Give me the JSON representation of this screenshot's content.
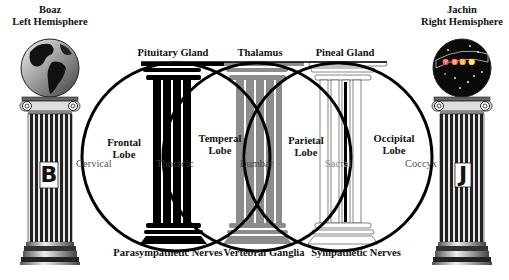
{
  "pillars": {
    "left": {
      "name": "Boaz",
      "subtitle": "Left Hemisphere",
      "letter": "B",
      "sphere": "terrestrial-globe"
    },
    "right": {
      "name": "Jachin",
      "subtitle": "Right Hemisphere",
      "letter": "J",
      "sphere": "celestial-globe"
    }
  },
  "inner_pillars": [
    {
      "top_label": "Pituitary Gland",
      "bottom_label": "Parasympathetic Nerves",
      "shaft_label": "Thoracic",
      "color": "#000000"
    },
    {
      "top_label": "Thalamus",
      "bottom_label": "Vertebral Ganglia",
      "shaft_label": "Lumbar",
      "color": "#8c8c8c"
    },
    {
      "top_label": "Pineal Gland",
      "bottom_label": "Sympathetic Nerves",
      "shaft_label": "Sacral",
      "color": "#ffffff"
    }
  ],
  "lobes": [
    {
      "label_line1": "Frontal",
      "label_line2": "Lobe"
    },
    {
      "label_line1": "Temperal",
      "label_line2": "Lobe"
    },
    {
      "label_line1": "Parietal",
      "label_line2": "Lobe"
    },
    {
      "label_line1": "Occipital",
      "label_line2": "Lobe"
    }
  ],
  "spine_labels": {
    "left": "Cervical",
    "right": "Coccyx"
  },
  "colors": {
    "line": "#000000",
    "gray_pillar": "#8c8c8c",
    "background": "#ffffff"
  }
}
